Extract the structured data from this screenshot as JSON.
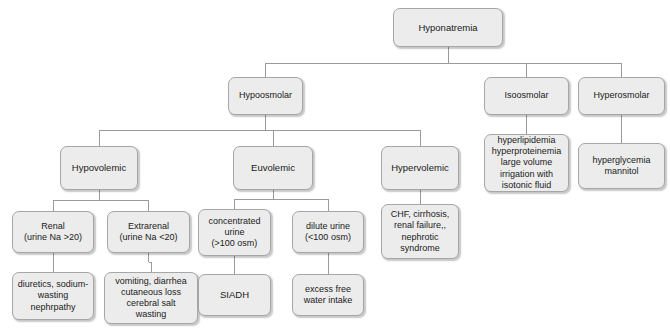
{
  "diagram": {
    "type": "flowchart",
    "background_color": "#ffffff",
    "node_fill_color": "#ececec",
    "node_border_color": "#a6a6a6",
    "edge_color": "#9a9a9a",
    "text_color": "#1a1a1a",
    "nodes": [
      {
        "id": "hyponatremia",
        "label": "Hyponatremia",
        "x": 393,
        "y": 8,
        "w": 110,
        "h": 39
      },
      {
        "id": "hypoosmolar",
        "label": "Hypoosmolar",
        "x": 228,
        "y": 77,
        "w": 75,
        "h": 38
      },
      {
        "id": "isoosmolar",
        "label": "Isoosmolar",
        "x": 484,
        "y": 77,
        "w": 85,
        "h": 38
      },
      {
        "id": "hyperosmolar",
        "label": "Hyperosmolar",
        "x": 578,
        "y": 77,
        "w": 87,
        "h": 38
      },
      {
        "id": "hypovolemic",
        "label": "Hypovolemic",
        "x": 60,
        "y": 146,
        "w": 78,
        "h": 44
      },
      {
        "id": "euvolemic",
        "label": "Euvolemic",
        "x": 233,
        "y": 146,
        "w": 80,
        "h": 44
      },
      {
        "id": "hypervolemic",
        "label": "Hypervolemic",
        "x": 381,
        "y": 146,
        "w": 78,
        "h": 44
      },
      {
        "id": "isoosmolar-causes",
        "label": "hyperlipidemia\nhyperproteinemia\nlarge volume\nirrigation with\nisotonic fluid",
        "x": 484,
        "y": 134,
        "w": 85,
        "h": 58
      },
      {
        "id": "hyperosmolar-causes",
        "label": "hyperglycemia\nmannitol",
        "x": 578,
        "y": 143,
        "w": 87,
        "h": 46
      },
      {
        "id": "renal",
        "label": "Renal\n(urine Na >20)",
        "x": 12,
        "y": 211,
        "w": 82,
        "h": 42
      },
      {
        "id": "extrarenal",
        "label": "Extrarenal\n(urine Na <20)",
        "x": 107,
        "y": 211,
        "w": 83,
        "h": 42
      },
      {
        "id": "concentrated-urine",
        "label": "concentrated\nurine\n(>100 osm)",
        "x": 198,
        "y": 209,
        "w": 73,
        "h": 47
      },
      {
        "id": "dilute-urine",
        "label": "dilute urine\n(<100 osm)",
        "x": 292,
        "y": 211,
        "w": 72,
        "h": 42
      },
      {
        "id": "hypervolemic-causes",
        "label": "CHF, cirrhosis,\nrenal failure,,\nnephrotic\nsyndrome",
        "x": 381,
        "y": 204,
        "w": 78,
        "h": 55
      },
      {
        "id": "renal-causes",
        "label": "diuretics, sodium-\nwasting\nnephrpathy",
        "x": 12,
        "y": 272,
        "w": 82,
        "h": 48
      },
      {
        "id": "extrarenal-causes",
        "label": "vomiting, diarrhea\ncutaneous loss\ncerebral salt\nwasting",
        "x": 104,
        "y": 272,
        "w": 94,
        "h": 52
      },
      {
        "id": "siadh",
        "label": "SIADH",
        "x": 198,
        "y": 274,
        "w": 73,
        "h": 42
      },
      {
        "id": "excess-water",
        "label": "excess free\nwater intake",
        "x": 292,
        "y": 274,
        "w": 72,
        "h": 42
      }
    ],
    "edges": [
      {
        "from": "hyponatremia",
        "to": "hypoosmolar",
        "bus_y": 63
      },
      {
        "from": "hyponatremia",
        "to": "isoosmolar",
        "bus_y": 63
      },
      {
        "from": "hyponatremia",
        "to": "hyperosmolar",
        "bus_y": 63
      },
      {
        "from": "hypoosmolar",
        "to": "hypovolemic",
        "bus_y": 130
      },
      {
        "from": "hypoosmolar",
        "to": "euvolemic",
        "bus_y": 130
      },
      {
        "from": "hypoosmolar",
        "to": "hypervolemic",
        "bus_y": 130
      },
      {
        "from": "isoosmolar",
        "to": "isoosmolar-causes",
        "bus_y": 126
      },
      {
        "from": "hyperosmolar",
        "to": "hyperosmolar-causes",
        "bus_y": 130
      },
      {
        "from": "hypovolemic",
        "to": "renal",
        "bus_y": 200
      },
      {
        "from": "hypovolemic",
        "to": "extrarenal",
        "bus_y": 200
      },
      {
        "from": "euvolemic",
        "to": "concentrated-urine",
        "bus_y": 199
      },
      {
        "from": "euvolemic",
        "to": "dilute-urine",
        "bus_y": 199
      },
      {
        "from": "hypervolemic",
        "to": "hypervolemic-causes",
        "bus_y": 197
      },
      {
        "from": "renal",
        "to": "renal-causes",
        "bus_y": 262
      },
      {
        "from": "extrarenal",
        "to": "extrarenal-causes",
        "bus_y": 262
      },
      {
        "from": "concentrated-urine",
        "to": "siadh",
        "bus_y": 265
      },
      {
        "from": "dilute-urine",
        "to": "excess-water",
        "bus_y": 263
      }
    ]
  }
}
